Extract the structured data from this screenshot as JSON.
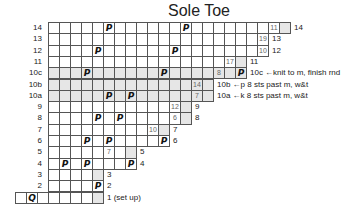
{
  "title": "Sole Toe",
  "grid": {
    "x0": 48,
    "y0": 22,
    "cw": 11,
    "rh": 11.3
  },
  "symbols": {
    "purl_like": "P",
    "setup": "Q"
  },
  "rows": [
    {
      "label": "14",
      "end": 22,
      "shadeFrom": 20,
      "marks": [
        [
          5,
          "P"
        ],
        [
          12,
          "P"
        ]
      ],
      "nums": [
        [
          20,
          "11"
        ]
      ],
      "note": "14",
      "noteOffset": 1
    },
    {
      "label": "13",
      "end": 20,
      "shadeFrom": 19,
      "marks": [],
      "nums": [
        [
          19,
          "19"
        ]
      ],
      "note": "13"
    },
    {
      "label": "12",
      "end": 20,
      "shadeFrom": 19,
      "marks": [
        [
          4,
          "P"
        ],
        [
          11,
          "P"
        ]
      ],
      "nums": [
        [
          19,
          "10"
        ]
      ],
      "note": "12"
    },
    {
      "label": "11",
      "end": 18,
      "shadeFrom": 16,
      "marks": [],
      "nums": [
        [
          16,
          "17"
        ]
      ],
      "note": "11"
    },
    {
      "label": "10c",
      "end": 18,
      "shade": true,
      "marks": [
        [
          3,
          "P"
        ],
        [
          10,
          "P"
        ],
        [
          17,
          "P"
        ]
      ],
      "nums": [
        [
          15,
          "8"
        ]
      ],
      "note": "10c ←knit to m, finish rnd"
    },
    {
      "label": "10b",
      "end": 15,
      "shade": true,
      "marks": [],
      "nums": [
        [
          13,
          "14"
        ]
      ],
      "note": "10b ←p 8 sts past m, w&t"
    },
    {
      "label": "10a",
      "end": 15,
      "shade": true,
      "marks": [
        [
          5,
          "P"
        ],
        [
          7,
          "P"
        ]
      ],
      "nums": [
        [
          13,
          "7"
        ]
      ],
      "note": "10a ←k 8 sts past m, w&t"
    },
    {
      "label": "9",
      "end": 13,
      "shadeFrom": 11,
      "marks": [],
      "nums": [
        [
          11,
          "12"
        ]
      ],
      "note": "9"
    },
    {
      "label": "8",
      "end": 13,
      "shadeFrom": 11,
      "marks": [
        [
          4,
          "P"
        ],
        [
          6,
          "P"
        ]
      ],
      "nums": [
        [
          11,
          "6"
        ]
      ],
      "note": "8"
    },
    {
      "label": "7",
      "end": 11,
      "shadeFrom": 9,
      "marks": [],
      "nums": [
        [
          9,
          "10"
        ]
      ],
      "note": "7"
    },
    {
      "label": "6",
      "end": 11,
      "shadeFrom": 10,
      "marks": [
        [
          3,
          "P"
        ],
        [
          5,
          "P"
        ],
        [
          10,
          "P"
        ]
      ],
      "nums": [],
      "note": "6"
    },
    {
      "label": "5",
      "end": 8,
      "shadeFrom": 5,
      "marks": [],
      "nums": [
        [
          5,
          "7"
        ]
      ],
      "note": "5"
    },
    {
      "label": "4",
      "end": 8,
      "shadeFrom": 7,
      "marks": [
        [
          1,
          "P"
        ],
        [
          3,
          "P"
        ],
        [
          7,
          "P"
        ]
      ],
      "nums": [],
      "note": "4"
    },
    {
      "label": "3",
      "end": 5,
      "shadeFrom": 4,
      "marks": [],
      "nums": [],
      "note": "3"
    },
    {
      "label": "2",
      "end": 5,
      "shadeFrom": 4,
      "marks": [
        [
          4,
          "P"
        ]
      ],
      "nums": [],
      "note": "2"
    },
    {
      "label": "",
      "start": -3,
      "end": 5,
      "shadeFrom": 0,
      "marks": [
        [
          -2,
          "Q"
        ]
      ],
      "nums": [],
      "note": "1 (set up)"
    }
  ]
}
